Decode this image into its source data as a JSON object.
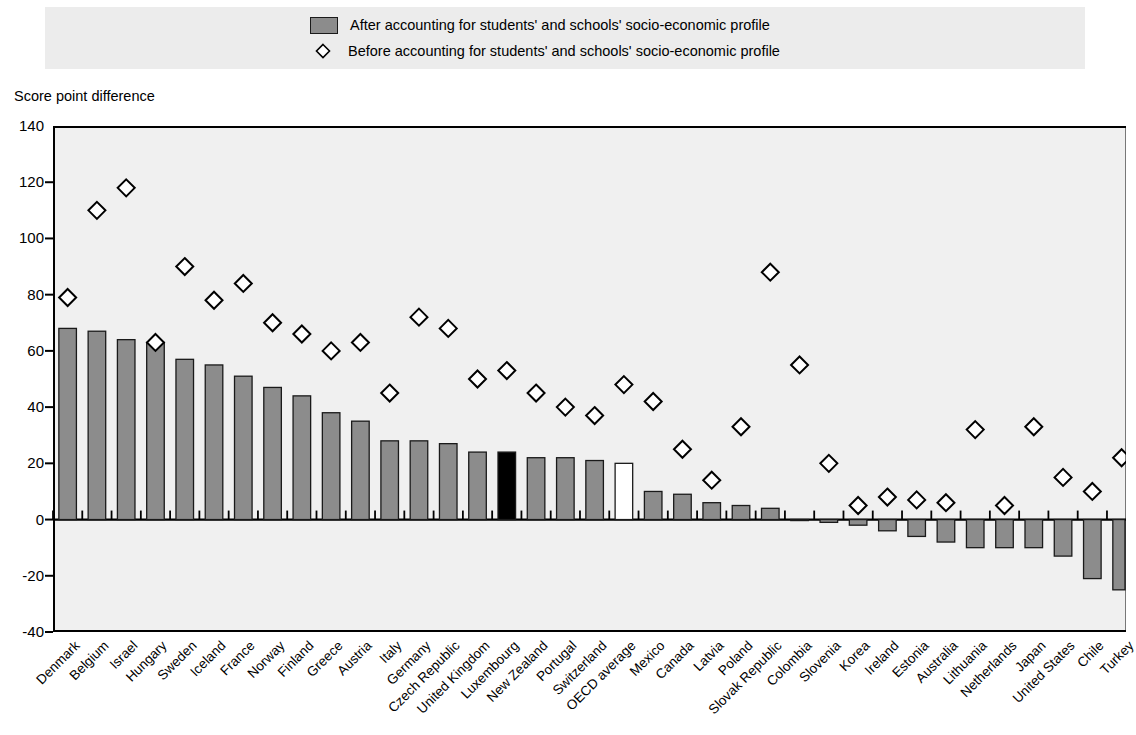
{
  "legend": {
    "items": [
      {
        "marker": "filled-square-swatch",
        "label": "After accounting for students' and schools' socio-economic profile"
      },
      {
        "marker": "open-diamond-marker",
        "label": "Before accounting for students' and schools' socio-economic profile"
      }
    ]
  },
  "axis": {
    "y_title": "Score point difference",
    "y_ticks": [
      "140",
      "120",
      "100",
      "80",
      "60",
      "40",
      "20",
      "0",
      "-20",
      "-40"
    ]
  },
  "colors": {
    "bar_default": "#8c8c8c",
    "bar_highlight": "#000000",
    "bar_average": "#ffffff",
    "bar_outline": "#1a1a1a",
    "plot_background": "#f0f0f0",
    "legend_background": "#ececec",
    "axis": "#000000"
  },
  "chart_data": {
    "type": "bar",
    "title": "",
    "subtitle": "",
    "xlabel": "",
    "ylabel": "Score point difference",
    "ylim": [
      -40,
      140
    ],
    "ytick_step": 20,
    "grid": false,
    "legend_position": "top",
    "categories": [
      "Denmark",
      "Belgium",
      "Israel",
      "Hungary",
      "Sweden",
      "Iceland",
      "France",
      "Norway",
      "Finland",
      "Greece",
      "Austria",
      "Italy",
      "Germany",
      "Czech Republic",
      "United Kingdom",
      "Luxembourg",
      "New Zealand",
      "Portugal",
      "Switzerland",
      "OECD average",
      "Mexico",
      "Canada",
      "Latvia",
      "Poland",
      "Slovak Republic",
      "Colombia",
      "Slovenia",
      "Korea",
      "Ireland",
      "Estonia",
      "Australia",
      "Lithuania",
      "Netherlands",
      "Japan",
      "United States",
      "Chile",
      "Turkey"
    ],
    "series": [
      {
        "name": "After accounting for students' and schools' socio-economic profile",
        "marker": "bar",
        "values": [
          68,
          67,
          64,
          63,
          57,
          55,
          51,
          47,
          44,
          38,
          35,
          28,
          28,
          27,
          24,
          24,
          22,
          22,
          21,
          20,
          10,
          9,
          6,
          5,
          4,
          0,
          -1,
          -2,
          -4,
          -6,
          -8,
          -10,
          -10,
          -10,
          -13,
          -21,
          -25
        ]
      },
      {
        "name": "Before accounting for students' and schools' socio-economic profile",
        "marker": "open-diamond",
        "values": [
          79,
          110,
          118,
          63,
          90,
          78,
          84,
          70,
          66,
          60,
          63,
          45,
          72,
          68,
          50,
          53,
          45,
          40,
          37,
          48,
          42,
          25,
          14,
          33,
          88,
          55,
          20,
          5,
          8,
          7,
          6,
          32,
          5,
          33,
          15,
          10,
          22
        ]
      }
    ],
    "highlighted_categories": {
      "Luxembourg": "highlight-black",
      "OECD average": "average-white"
    }
  }
}
